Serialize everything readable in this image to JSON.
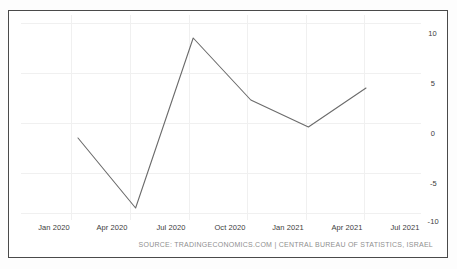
{
  "chart_data": {
    "type": "line",
    "title": "",
    "subtitle": "",
    "xlabel": "",
    "ylabel": "",
    "grid": true,
    "legend": "none",
    "xlim": [
      "Jan 2020",
      "Sep 2021"
    ],
    "ylim": [
      -10,
      10
    ],
    "y_ticks": [
      10,
      5,
      0,
      -5,
      -10
    ],
    "y_tick_labels": [
      "10",
      "5",
      "0",
      "-5",
      "-10"
    ],
    "x_ticks": [
      "Jan 2020",
      "Apr 2020",
      "Jul 2020",
      "Oct 2020",
      "Jan 2021",
      "Apr 2021",
      "Jul 2021"
    ],
    "series": [
      {
        "name": "GDP Growth Rate",
        "color": "#6b6b6b",
        "x": [
          "Mar 2020",
          "Jun 2020",
          "Sep 2020",
          "Dec 2020",
          "Mar 2021",
          "Jun 2021"
        ],
        "values": [
          -1.6,
          -8.6,
          8.4,
          2.2,
          -0.5,
          3.4
        ]
      }
    ],
    "source": "SOURCE: TRADINGECONOMICS.COM | CENTRAL BUREAU OF STATISTICS, ISRAEL"
  },
  "axis": {
    "y_labels": [
      "10",
      "5",
      "0",
      "-5",
      "-10"
    ],
    "x_labels": [
      "Jan 2020",
      "Apr 2020",
      "Jul 2020",
      "Oct 2020",
      "Jan 2021",
      "Apr 2021",
      "Jul 2021"
    ]
  },
  "footer": {
    "source_text": "SOURCE: TRADINGECONOMICS.COM | CENTRAL BUREAU OF STATISTICS, ISRAEL"
  },
  "colors": {
    "line": "#6b6b6b",
    "grid": "#f0f0f0",
    "frame": "#4a4a4a",
    "label": "#3c3c3c",
    "source": "#8f8f8f"
  }
}
